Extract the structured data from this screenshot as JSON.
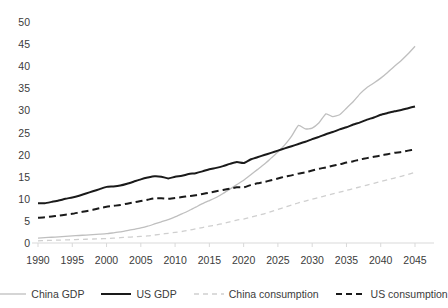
{
  "chart_data": {
    "type": "line",
    "title": "",
    "subtitle": "",
    "xlabel": "",
    "ylabel": "",
    "xlim": [
      1990,
      2045
    ],
    "ylim": [
      0,
      50
    ],
    "grid": false,
    "legend_position": "bottom",
    "x_ticks": [
      1990,
      1995,
      2000,
      2005,
      2010,
      2015,
      2020,
      2025,
      2030,
      2035,
      2040,
      2045
    ],
    "y_ticks": [
      0,
      5,
      10,
      15,
      20,
      25,
      30,
      35,
      40,
      45,
      50
    ],
    "x": [
      1990,
      1991,
      1992,
      1993,
      1994,
      1995,
      1996,
      1997,
      1998,
      1999,
      2000,
      2001,
      2002,
      2003,
      2004,
      2005,
      2006,
      2007,
      2008,
      2009,
      2010,
      2011,
      2012,
      2013,
      2014,
      2015,
      2016,
      2017,
      2018,
      2019,
      2020,
      2021,
      2022,
      2023,
      2024,
      2025,
      2026,
      2027,
      2028,
      2029,
      2030,
      2031,
      2032,
      2033,
      2034,
      2035,
      2036,
      2037,
      2038,
      2039,
      2040,
      2041,
      2042,
      2043,
      2044,
      2045
    ],
    "series": [
      {
        "name": "China GDP",
        "color": "#bfbfbf",
        "dash": "solid",
        "width": 1.3,
        "values": [
          1.1,
          1.2,
          1.3,
          1.4,
          1.5,
          1.6,
          1.7,
          1.8,
          1.9,
          2.0,
          2.1,
          2.3,
          2.5,
          2.8,
          3.1,
          3.4,
          3.8,
          4.3,
          4.8,
          5.3,
          5.9,
          6.6,
          7.3,
          8.1,
          8.9,
          9.6,
          10.3,
          11.2,
          12.2,
          13.2,
          14.2,
          15.4,
          16.6,
          17.8,
          19.2,
          20.6,
          22.2,
          24.2,
          26.6,
          25.8,
          26.0,
          27.2,
          29.2,
          28.6,
          29.0,
          30.5,
          32.0,
          33.8,
          35.2,
          36.2,
          37.3,
          38.6,
          40.0,
          41.3,
          42.8,
          44.5
        ]
      },
      {
        "name": "US GDP",
        "color": "#1a1a1a",
        "dash": "solid",
        "width": 2.0,
        "values": [
          9.0,
          9.0,
          9.3,
          9.6,
          10.0,
          10.3,
          10.7,
          11.2,
          11.7,
          12.2,
          12.7,
          12.8,
          13.0,
          13.4,
          13.9,
          14.4,
          14.8,
          15.1,
          15.0,
          14.6,
          15.0,
          15.2,
          15.6,
          15.8,
          16.2,
          16.7,
          17.0,
          17.4,
          17.9,
          18.3,
          18.1,
          18.9,
          19.4,
          19.9,
          20.4,
          20.9,
          21.4,
          21.9,
          22.4,
          22.9,
          23.5,
          24.0,
          24.6,
          25.1,
          25.7,
          26.2,
          26.8,
          27.3,
          27.9,
          28.4,
          29.0,
          29.4,
          29.8,
          30.1,
          30.5,
          30.9
        ]
      },
      {
        "name": "China consumption",
        "color": "#cfcfcf",
        "dash": "dashed",
        "width": 1.3,
        "values": [
          0.5,
          0.55,
          0.6,
          0.65,
          0.7,
          0.75,
          0.8,
          0.85,
          0.9,
          0.95,
          1.0,
          1.1,
          1.2,
          1.3,
          1.4,
          1.5,
          1.6,
          1.8,
          2.0,
          2.2,
          2.4,
          2.6,
          2.9,
          3.2,
          3.5,
          3.8,
          4.1,
          4.4,
          4.8,
          5.2,
          5.4,
          5.8,
          6.2,
          6.6,
          7.1,
          7.6,
          8.1,
          8.6,
          9.1,
          9.5,
          9.9,
          10.3,
          10.7,
          11.1,
          11.5,
          11.9,
          12.3,
          12.7,
          13.1,
          13.5,
          13.9,
          14.3,
          14.7,
          15.1,
          15.5,
          16.0
        ]
      },
      {
        "name": "US consumption",
        "color": "#1a1a1a",
        "dash": "dashed",
        "width": 2.0,
        "values": [
          5.7,
          5.8,
          6.0,
          6.2,
          6.4,
          6.6,
          6.9,
          7.2,
          7.5,
          7.9,
          8.2,
          8.4,
          8.6,
          8.9,
          9.2,
          9.5,
          9.8,
          10.1,
          10.1,
          10.0,
          10.2,
          10.4,
          10.6,
          10.8,
          11.1,
          11.4,
          11.7,
          12.0,
          12.3,
          12.6,
          12.6,
          13.1,
          13.5,
          13.8,
          14.2,
          14.6,
          15.0,
          15.3,
          15.7,
          16.0,
          16.4,
          16.8,
          17.1,
          17.5,
          17.8,
          18.2,
          18.5,
          18.9,
          19.2,
          19.5,
          19.8,
          20.1,
          20.4,
          20.6,
          20.9,
          21.2
        ]
      }
    ]
  },
  "axes": {
    "y_tick_labels": [
      "50",
      "45",
      "40",
      "35",
      "30",
      "25",
      "20",
      "15",
      "10",
      "5",
      "0"
    ],
    "x_tick_labels": [
      "1990",
      "1995",
      "2000",
      "2005",
      "2010",
      "2015",
      "2020",
      "2025",
      "2030",
      "2035",
      "2040",
      "2045"
    ]
  },
  "legend": {
    "items": [
      {
        "label": "China GDP",
        "color": "#bfbfbf",
        "dash": "solid",
        "width": 1.3
      },
      {
        "label": "US GDP",
        "color": "#1a1a1a",
        "dash": "solid",
        "width": 2.0
      },
      {
        "label": "China consumption",
        "color": "#cfcfcf",
        "dash": "dashed",
        "width": 1.3
      },
      {
        "label": "US consumption",
        "color": "#1a1a1a",
        "dash": "dashed",
        "width": 2.0
      }
    ]
  },
  "colors": {
    "background": "#ffffff",
    "axis_line": "#d9d9d9",
    "text": "#3b3b3b"
  }
}
